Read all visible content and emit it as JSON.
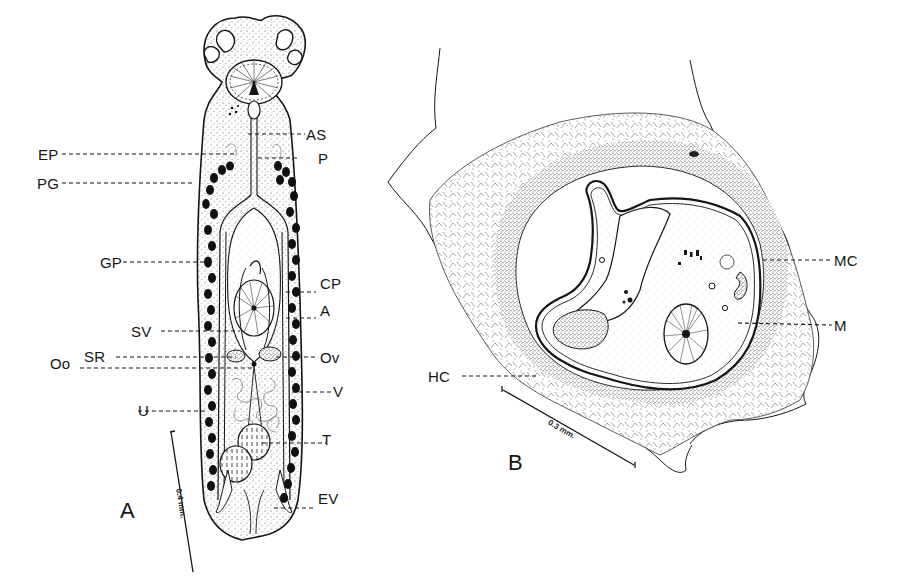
{
  "figure": {
    "panels": [
      {
        "id": "A",
        "label": "A",
        "scale_bar": "0.4 mm.",
        "labels_left": [
          {
            "key": "EP",
            "text": "EP"
          },
          {
            "key": "PG",
            "text": "PG"
          },
          {
            "key": "GP",
            "text": "GP"
          },
          {
            "key": "SV",
            "text": "SV"
          },
          {
            "key": "SR",
            "text": "SR"
          },
          {
            "key": "Oo",
            "text": "Oo"
          },
          {
            "key": "U",
            "text": "U"
          }
        ],
        "labels_right": [
          {
            "key": "AS",
            "text": "AS"
          },
          {
            "key": "P",
            "text": "P"
          },
          {
            "key": "CP",
            "text": "CP"
          },
          {
            "key": "A",
            "text": "A"
          },
          {
            "key": "Ov",
            "text": "Ov"
          },
          {
            "key": "V",
            "text": "V"
          },
          {
            "key": "T",
            "text": "T"
          },
          {
            "key": "EV",
            "text": "EV"
          }
        ]
      },
      {
        "id": "B",
        "label": "B",
        "scale_bar": "0.3 mm.",
        "labels": [
          {
            "key": "MC",
            "text": "MC"
          },
          {
            "key": "M",
            "text": "M"
          },
          {
            "key": "HC",
            "text": "HC"
          }
        ]
      }
    ],
    "colors": {
      "ink": "#151515",
      "paper": "#ffffff",
      "stipple": "#6a6a6a"
    }
  }
}
